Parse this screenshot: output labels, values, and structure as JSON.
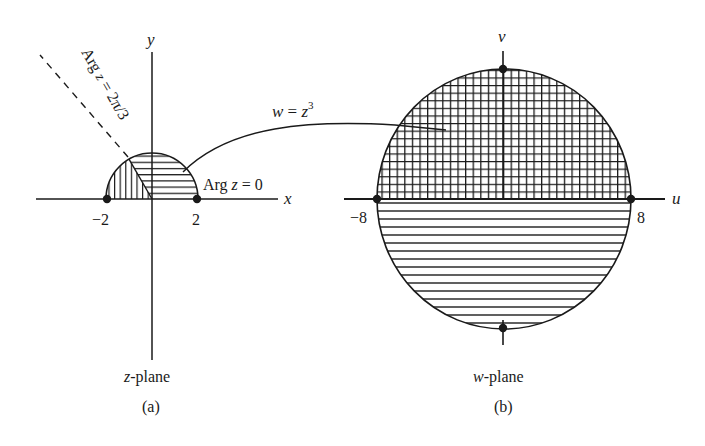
{
  "figure": {
    "panel_a": {
      "axis_x_label": "x",
      "axis_y_label": "y",
      "tick_neg": "−2",
      "tick_pos": "2",
      "ray_label_prefix": "Arg ",
      "ray_label_var": "z",
      "ray_label_suffix": " = 2π/3",
      "arg0_prefix": "Arg ",
      "arg0_var": "z",
      "arg0_suffix": " = 0",
      "plane_var": "z",
      "plane_suffix": "-plane",
      "caption": "(a)"
    },
    "panel_b": {
      "axis_u_label": "u",
      "axis_v_label": "v",
      "tick_neg": "−8",
      "tick_pos": "8",
      "plane_var": "w",
      "plane_suffix": "-plane",
      "caption": "(b)"
    },
    "mapping": {
      "lhs": "w",
      "eq": " = ",
      "rhs": "z",
      "exp": "3"
    },
    "colors": {
      "ink": "#1a1a1a",
      "background": "#ffffff"
    }
  }
}
